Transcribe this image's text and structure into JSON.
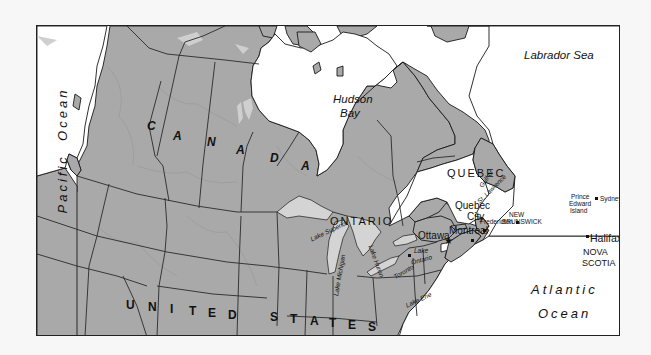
{
  "map": {
    "type": "reference-map",
    "colors": {
      "land": "#a9a9a9",
      "water": "#ffffff",
      "lakes": "#d4d4d4",
      "borders": "#1a1a1a",
      "frame": "#222222"
    },
    "countries": {
      "canada": [
        "C",
        "A",
        "N",
        "A",
        "D",
        "A"
      ],
      "united_states": [
        "U",
        "N",
        "I",
        "T",
        "E",
        "D",
        "S",
        "T",
        "A",
        "T",
        "E",
        "S"
      ]
    },
    "water_bodies": {
      "pacific": [
        "Pacific",
        "Ocean"
      ],
      "atlantic_1": "Atlantic",
      "atlantic_2": "Ocean",
      "hudson_1": "Hudson",
      "hudson_2": "Bay",
      "labrador": "Labrador Sea",
      "gulf_1": "Gulf of",
      "gulf_2": "St. Lawrence"
    },
    "provinces": {
      "ontario": "ONTARIO",
      "quebec": "QUEBEC",
      "new_brunswick_1": "NEW",
      "new_brunswick_2": "BRUNSWICK",
      "pei_1": "Prince",
      "pei_2": "Edward",
      "pei_3": "Island",
      "nova_scotia_1": "NOVA",
      "nova_scotia_2": "SCOTIA"
    },
    "cities": {
      "ottawa": "Ottawa",
      "montreal": "Montreal",
      "quebec_city_1": "Quebec",
      "quebec_city_2": "City",
      "toronto": "Toronto",
      "fredericton": "Fredericton",
      "halifax": "Halifax",
      "sydney": "Sydney"
    },
    "lakes": {
      "superior": "Lake Superior",
      "michigan": "Lake Michigan",
      "huron": "Lake Huron",
      "erie": "Lake Erie",
      "ontario_1": "Lake",
      "ontario_2": "Ontario"
    },
    "capital_symbol": "★"
  }
}
